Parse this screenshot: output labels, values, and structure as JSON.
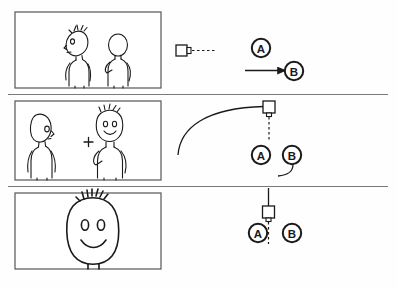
{
  "document": {
    "title": "Storyboard — camera staging sheet",
    "type": "hand-drawn storyboard",
    "rows": 3,
    "ink_color": "#1a1a1a",
    "frame_border_color": "#555555",
    "divider_color": "#7a7a7a",
    "paper_color": "#fefefe"
  },
  "rows": [
    {
      "id": "row-1",
      "panel": {
        "name": "panel-1",
        "description": "Two stick characters standing in profile; spiky-haired character on the left facing right-to-left, plain bald character on the right",
        "characters": [
          {
            "name": "spiky-haired-character",
            "facing": "left",
            "hair": "spiky"
          },
          {
            "name": "bald-character",
            "facing": "right",
            "hair": "none"
          }
        ]
      },
      "diagram": {
        "name": "staging-diagram-1",
        "camera": {
          "label": "camera-icon",
          "orientation": "facing-right",
          "x": 182,
          "y": 52
        },
        "sightline": {
          "style": "dashed",
          "direction": "right"
        },
        "move_path": {
          "style": "straight-arrow",
          "direction": "right",
          "target": "B"
        },
        "marks": [
          {
            "label": "A",
            "x": 261,
            "y": 48
          },
          {
            "label": "B",
            "x": 294,
            "y": 72
          }
        ]
      }
    },
    {
      "id": "row-2",
      "panel": {
        "name": "panel-2",
        "description": "Two stick characters facing each other in medium shot with a small crosshair framing mark between them",
        "characters": [
          {
            "name": "bald-character",
            "facing": "right",
            "hair": "none"
          },
          {
            "name": "spiky-haired-character",
            "facing": "front",
            "hair": "spiky"
          }
        ],
        "marks": [
          {
            "label": "framing-crosshair",
            "symbol": "+",
            "x": 88,
            "y": 142
          }
        ]
      },
      "diagram": {
        "name": "staging-diagram-2",
        "camera": {
          "label": "camera-icon",
          "orientation": "facing-down",
          "x": 270,
          "y": 107
        },
        "sightline": {
          "style": "dashed",
          "direction": "down"
        },
        "move_path": {
          "style": "curved-arc",
          "direction": "from-lower-left-to-camera"
        },
        "marks": [
          {
            "label": "A",
            "x": 261,
            "y": 155
          },
          {
            "label": "B",
            "x": 292,
            "y": 155
          }
        ],
        "action_curve": {
          "from": "B",
          "direction": "down-left"
        }
      }
    },
    {
      "id": "row-3",
      "panel": {
        "name": "panel-3",
        "description": "Extreme close-up of the spiky-haired character's smiling face",
        "characters": [
          {
            "name": "spiky-haired-character",
            "facing": "front",
            "hair": "spiky",
            "expression": "smiling"
          }
        ]
      },
      "diagram": {
        "name": "staging-diagram-3",
        "camera": {
          "label": "camera-icon",
          "orientation": "facing-down",
          "x": 268,
          "y": 212
        },
        "sightline": {
          "style": "dashed",
          "direction": "down"
        },
        "move_path": {
          "style": "straight-line",
          "direction": "up"
        },
        "marks": [
          {
            "label": "A",
            "x": 259,
            "y": 233
          },
          {
            "label": "B",
            "x": 292,
            "y": 233
          }
        ]
      }
    }
  ],
  "labels": {
    "mark_a": "A",
    "mark_b": "B",
    "crosshair": "+"
  }
}
